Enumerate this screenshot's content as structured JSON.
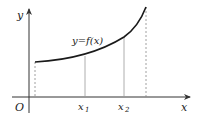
{
  "diagram": {
    "type": "function-graph",
    "curve_label": "y=f(x)",
    "axes": {
      "x_label": "x",
      "y_label": "y",
      "origin_label": "O"
    },
    "ticks": [
      {
        "label": "x",
        "sub": "1"
      },
      {
        "label": "x",
        "sub": "2"
      }
    ],
    "colors": {
      "axis": "#333333",
      "curve": "#1a1a1a",
      "guide": "#888888"
    }
  }
}
